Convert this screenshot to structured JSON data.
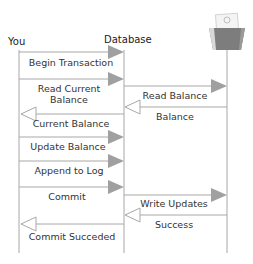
{
  "diagram": {
    "type": "sequence",
    "colors": {
      "line": "#a8a8a8",
      "arrow_fill": "#a0a0a0",
      "text": "#333333",
      "folder_dark": "#7d7d7d",
      "folder_light": "#d8d8d8"
    },
    "participants": [
      {
        "id": "you",
        "label": "You"
      },
      {
        "id": "database",
        "label": "Database"
      },
      {
        "id": "storage",
        "label": "",
        "icon": "file-folder-icon"
      }
    ],
    "messages": [
      {
        "from": "you",
        "to": "database",
        "label": "Begin Transaction",
        "style": "solid-filled"
      },
      {
        "from": "you",
        "to": "database",
        "label_line1": "Read Current",
        "label_line2": "Balance",
        "style": "solid-filled"
      },
      {
        "from": "database",
        "to": "storage",
        "label": "Read Balance",
        "style": "solid-filled"
      },
      {
        "from": "storage",
        "to": "database",
        "label": "Balance",
        "style": "return-open"
      },
      {
        "from": "database",
        "to": "you",
        "label": "Current Balance",
        "style": "return-open"
      },
      {
        "from": "you",
        "to": "database",
        "label": "Update Balance",
        "style": "solid-filled"
      },
      {
        "from": "you",
        "to": "database",
        "label": "Append to Log",
        "style": "solid-filled"
      },
      {
        "from": "you",
        "to": "database",
        "label": "Commit",
        "style": "solid-filled"
      },
      {
        "from": "database",
        "to": "storage",
        "label": "Write Updates",
        "style": "solid-filled"
      },
      {
        "from": "storage",
        "to": "database",
        "label": "Success",
        "style": "return-open"
      },
      {
        "from": "database",
        "to": "you",
        "label": "Commit Succeded",
        "style": "return-open"
      }
    ]
  }
}
